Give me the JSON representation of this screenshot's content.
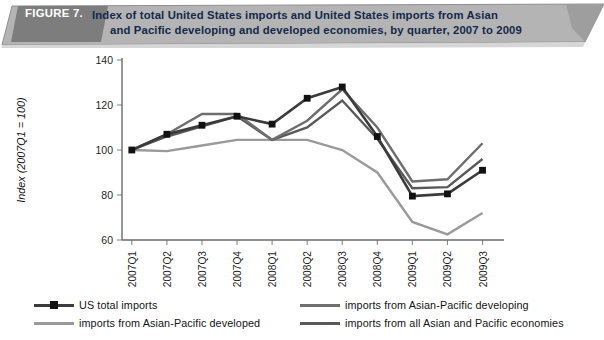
{
  "figure": {
    "label": "FIGURE 7.",
    "title_line1": "Index of total United States imports and United States imports from Asian",
    "title_line2": "and Pacific developing and developed economies, by quarter, 2007 to 2009",
    "banner_fill": "#b4b4b4",
    "banner_label_fill": "#7d7d7d",
    "title_color": "#13294b"
  },
  "legend": {
    "position": "bottom",
    "entries": [
      {
        "label": "US total imports",
        "color": "#3b3b3b",
        "has_marker": true,
        "marker": "square",
        "column": "left"
      },
      {
        "label": "imports from Asian-Pacific developed",
        "color": "#9a9a9a",
        "has_marker": false,
        "marker": "none",
        "column": "left"
      },
      {
        "label": "imports from Asian-Pacific developing",
        "color": "#6e6e6e",
        "has_marker": false,
        "marker": "none",
        "column": "right"
      },
      {
        "label": "imports from all Asian and Pacific economies",
        "color": "#595959",
        "has_marker": false,
        "marker": "none",
        "column": "right"
      }
    ]
  },
  "bottom_caption": {
    "text": ""
  },
  "chart_data": {
    "type": "line",
    "title": "Index of total United States imports and United States imports from Asian and Pacific developing and developed economies, by quarter, 2007 to 2009",
    "xlabel": "",
    "ylabel": "Index (2007Q1 = 100)",
    "ylim": [
      60,
      140
    ],
    "yticks": [
      60,
      80,
      100,
      120,
      140
    ],
    "grid": false,
    "legend_position": "bottom",
    "categories": [
      "2007Q1",
      "2007Q2",
      "2007Q3",
      "2007Q4",
      "2008Q1",
      "2008Q2",
      "2008Q3",
      "2008Q4",
      "2009Q1",
      "2009Q2",
      "2009Q3"
    ],
    "series": [
      {
        "name": "US total imports",
        "color": "#3b3b3b",
        "marker": "square",
        "values": [
          100,
          107,
          111,
          115,
          111.5,
          123,
          128,
          106,
          79.5,
          80.5,
          91
        ]
      },
      {
        "name": "imports from Asian-Pacific developed",
        "color": "#9a9a9a",
        "marker": "none",
        "values": [
          100,
          99.5,
          102,
          104.5,
          104.5,
          104.5,
          100,
          90,
          68,
          62.5,
          72
        ]
      },
      {
        "name": "imports from Asian-Pacific developing",
        "color": "#6e6e6e",
        "marker": "none",
        "values": [
          100,
          107,
          116,
          116,
          104.5,
          113,
          127,
          110,
          86,
          87,
          103
        ]
      },
      {
        "name": "imports from all Asian and Pacific economies",
        "color": "#595959",
        "marker": "none",
        "values": [
          100,
          106,
          110.5,
          115,
          104.5,
          110,
          122,
          105,
          83,
          83.5,
          96
        ]
      }
    ]
  }
}
